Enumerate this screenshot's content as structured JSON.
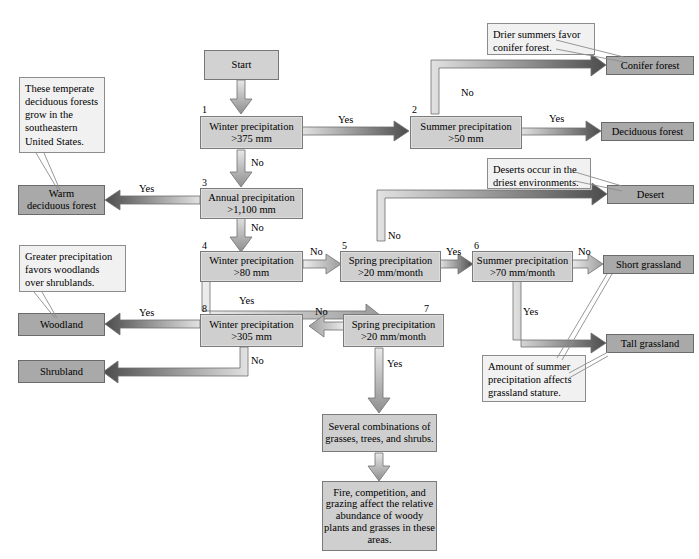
{
  "diagram": {
    "colors": {
      "decision_fill": "#cfcfcf",
      "outcome_fill": "#a9a9a9",
      "callout_fill": "#f1f1f1",
      "border": "#7a7a7a",
      "arrow_dark": "#4a4a4a",
      "arrow_light": "#d9d9d9"
    }
  },
  "start": {
    "label": "Start"
  },
  "decisions": [
    {
      "num": "1",
      "line1": "Winter precipitation",
      "line2": ">375 mm"
    },
    {
      "num": "2",
      "line1": "Summer precipitation",
      "line2": ">50 mm"
    },
    {
      "num": "3",
      "line1": "Annual precipitation",
      "line2": ">1,100 mm"
    },
    {
      "num": "4",
      "line1": "Winter precipitation",
      "line2": ">80 mm"
    },
    {
      "num": "5",
      "line1": "Spring precipitation",
      "line2": ">20 mm/month"
    },
    {
      "num": "6",
      "line1": "Summer precipitation",
      "line2": ">70 mm/month"
    },
    {
      "num": "7",
      "line1": "Spring precipitation",
      "line2": ">20 mm/month"
    },
    {
      "num": "8",
      "line1": "Winter precipitation",
      "line2": ">305 mm"
    }
  ],
  "outcomes": [
    {
      "id": "conifer-forest",
      "label": "Conifer forest"
    },
    {
      "id": "deciduous-forest",
      "label": "Deciduous forest"
    },
    {
      "id": "desert",
      "label": "Desert"
    },
    {
      "id": "short-grassland",
      "label": "Short grassland"
    },
    {
      "id": "tall-grassland",
      "label": "Tall grassland"
    },
    {
      "id": "warm-deciduous-forest",
      "line1": "Warm",
      "line2": "deciduous forest"
    },
    {
      "id": "woodland",
      "label": "Woodland"
    },
    {
      "id": "shrubland",
      "label": "Shrubland"
    }
  ],
  "callouts": [
    {
      "id": "temperate-deciduous-note",
      "text": "These temperate deciduous forests grow in the southeastern United  States."
    },
    {
      "id": "conifer-note",
      "text": "Drier summers favor conifer forest."
    },
    {
      "id": "desert-note",
      "text": "Deserts occur in the driest environments."
    },
    {
      "id": "woodland-note",
      "text": "Greater precipitation favors woodlands over shrublands."
    },
    {
      "id": "grassland-note",
      "text": "Amount of summer precipitation affects grassland stature."
    }
  ],
  "summaries": [
    {
      "id": "combinations",
      "text": "Several combinations of grasses, trees, and shrubs."
    },
    {
      "id": "fire-competition",
      "text": "Fire, competition, and grazing affect the relative abundance of woody plants and grasses in these areas."
    }
  ],
  "edge_labels": {
    "d1_yes": "Yes",
    "d1_no": "No",
    "d2_no": "No",
    "d2_yes": "Yes",
    "d3_yes": "Yes",
    "d3_no": "No",
    "d4_no": "No",
    "d4_yes": "Yes",
    "d5_no": "No",
    "d5_yes": "Yes",
    "d6_no": "No",
    "d6_yes": "Yes",
    "d7_no": "No",
    "d7_yes": "Yes",
    "d8_yes": "Yes",
    "d8_no": "No"
  }
}
